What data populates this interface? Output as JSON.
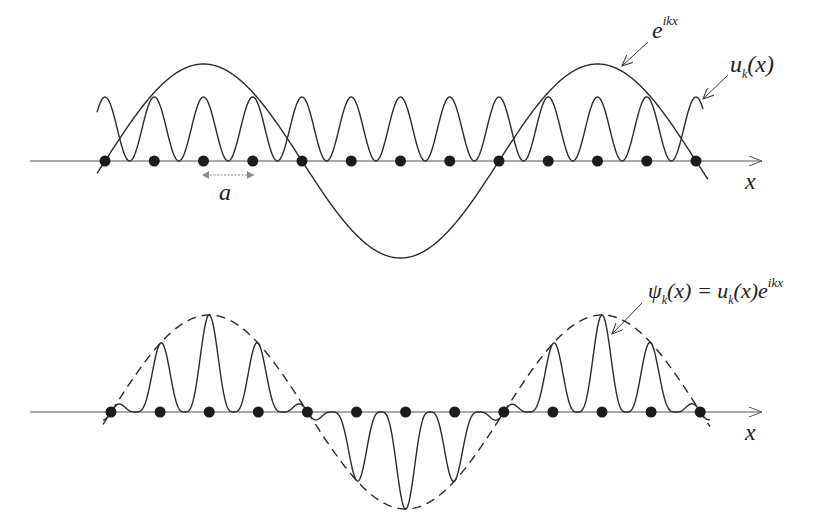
{
  "diagram": {
    "colors": {
      "curve": "#2a2a2a",
      "axis": "#555555",
      "atom": "#1e1a1a",
      "spacing_arrow": "#8a8a8a"
    },
    "top_panel": {
      "axis": {
        "x_start": 30,
        "x_end": 762,
        "y": 161,
        "label": "x"
      },
      "atoms": {
        "x_first": 105,
        "spacing": 49.25,
        "count": 13
      },
      "spacing_marker": {
        "label": "a",
        "x1": 203,
        "x2": 254,
        "y": 175
      },
      "plane_wave": {
        "label_base": "e",
        "label_sup": "ikx",
        "amplitude": 97,
        "zero_at": 105,
        "half_period": 197,
        "x_from": 97,
        "x_to": 708
      },
      "periodic_function": {
        "label_base": "u",
        "label_sub": "k",
        "label_tail": "(x)",
        "top_y": 97,
        "x_from": 97,
        "x_to": 703
      }
    },
    "bottom_panel": {
      "axis": {
        "x_start": 30,
        "x_end": 762,
        "y": 412,
        "label": "x"
      },
      "atoms": {
        "x_first": 111,
        "spacing": 49.1,
        "count": 13
      },
      "envelope": {
        "style": "dashed",
        "amplitude": 97,
        "zero_at": 111,
        "half_period": 196.5,
        "x_from": 103,
        "x_to": 710
      },
      "bloch_wave": {
        "label": "ψ_k(x) = u_k(x) e^{ikx}",
        "label_psi": "ψ",
        "label_sub": "k",
        "label_mid": "(x) = u",
        "label_sub2": "k",
        "label_tail": "(x)e",
        "label_sup": "ikx",
        "x_from": 103,
        "x_to": 710
      }
    }
  }
}
